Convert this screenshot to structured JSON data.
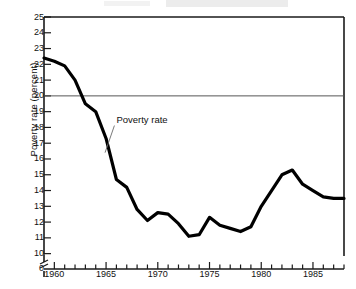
{
  "figure": {
    "ylabel": "Poverty rate (percent)",
    "annotation": "Poverty rate",
    "zero_label": "0"
  },
  "chart_data": {
    "type": "line",
    "title": "",
    "xlabel": "",
    "ylabel": "Poverty rate (percent)",
    "xlim": [
      1959,
      1988
    ],
    "ylim": [
      9.3,
      25
    ],
    "y_axis_break": true,
    "y_break_between": [
      0,
      9.3
    ],
    "grid": false,
    "reference_lines": [
      {
        "y": 20,
        "color": "#555555",
        "width": 1,
        "label": ""
      }
    ],
    "legend": "none",
    "annotations": [
      {
        "text": "Poverty rate",
        "x": 1966.0,
        "y": 18.5,
        "points_to_x": 1964.9,
        "points_to_y": 16.4
      }
    ],
    "ytick_labels": [
      25,
      24,
      23,
      22,
      21,
      20,
      19,
      18,
      17,
      16,
      15,
      14,
      13,
      12,
      11,
      10,
      0
    ],
    "xtick_labels": [
      1960,
      1965,
      1970,
      1975,
      1980,
      1985
    ],
    "xtick_minor_every": 1,
    "series": [
      {
        "name": "Poverty rate",
        "color": "#000000",
        "width": 3.2,
        "x": [
          1959,
          1960,
          1961,
          1962,
          1963,
          1964,
          1965,
          1966,
          1967,
          1968,
          1969,
          1970,
          1971,
          1972,
          1973,
          1974,
          1975,
          1976,
          1977,
          1978,
          1979,
          1980,
          1981,
          1982,
          1983,
          1984,
          1985,
          1986,
          1987,
          1988
        ],
        "values": [
          22.4,
          22.2,
          21.9,
          21.0,
          19.5,
          19.0,
          17.3,
          14.7,
          14.2,
          12.8,
          12.1,
          12.6,
          12.5,
          11.9,
          11.1,
          11.2,
          12.3,
          11.8,
          11.6,
          11.4,
          11.7,
          13.0,
          14.0,
          15.0,
          15.3,
          14.4,
          14.0,
          13.6,
          13.5,
          13.5
        ]
      }
    ]
  }
}
